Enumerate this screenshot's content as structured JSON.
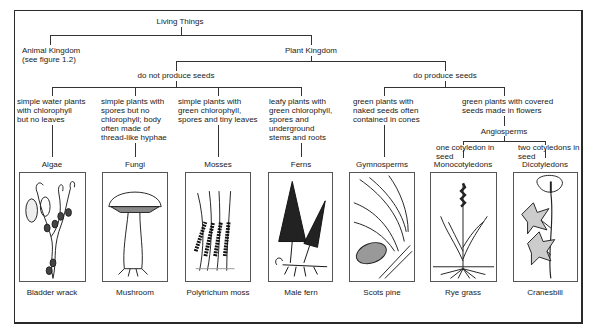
{
  "diagram": {
    "root": "Living Things",
    "animal_kingdom": {
      "label": "Animal Kingdom",
      "note": "(see figure 1.2)"
    },
    "plant_kingdom": "Plant Kingdom",
    "no_seeds": "do not produce seeds",
    "seeds": "do produce seeds",
    "angiosperms": "Angiosperms",
    "descriptions": {
      "algae": [
        "simple water plants",
        "with chlorophyll",
        "but no leaves"
      ],
      "fungi": [
        "simple plants with",
        "spores but no",
        "chlorophyll; body",
        "often made of",
        "thread-like hyphae"
      ],
      "mosses": [
        "simple plants with",
        "green chlorophyll,",
        "spores and tiny leaves"
      ],
      "ferns": [
        "leafy plants with",
        "green chlorophyll,",
        "spores and",
        "underground",
        "stems and roots"
      ],
      "gymnosperms": [
        "green plants with",
        "naked seeds often",
        "contained in cones"
      ],
      "angio": [
        "green plants with covered",
        "seeds made in flowers"
      ],
      "mono": [
        "one cotyledon in",
        "seed"
      ],
      "dico": [
        "two cotyledons in",
        "seed"
      ]
    },
    "groups": [
      "Algae",
      "Fungi",
      "Mosses",
      "Ferns",
      "Gymnosperms",
      "Monocotyledons",
      "Dicotyledons"
    ],
    "examples": [
      "Bladder wrack",
      "Mushroom",
      "Polytrichum moss",
      "Male fern",
      "Scots pine",
      "Rye grass",
      "Cranesbill"
    ]
  }
}
